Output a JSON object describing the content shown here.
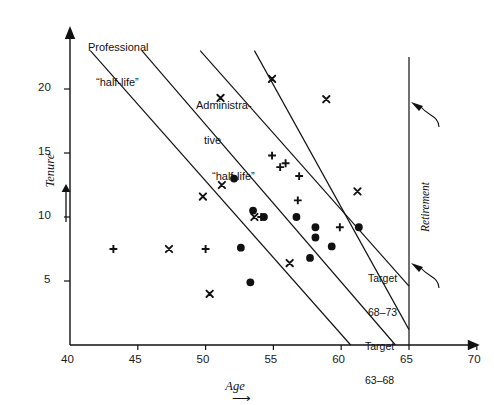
{
  "figure": {
    "kind": "scatter-plot",
    "ink_color": "#111111",
    "background": "#ffffff"
  },
  "axes": {
    "x": {
      "label": "Age",
      "label_arrow": "⟶",
      "ticks": [
        40,
        45,
        50,
        55,
        60,
        65,
        70
      ],
      "min": 40,
      "max": 70,
      "arrow_head": true
    },
    "y": {
      "label": "Tenure",
      "label_arrow": "↑",
      "ticks": [
        5,
        10,
        15,
        20
      ],
      "min": 0,
      "max": 23,
      "arrow_head": true
    }
  },
  "annotations": {
    "professional": {
      "line1": "Professional",
      "line2": "“half-life”"
    },
    "administrative": {
      "line1": "Administra-",
      "line2": "tive",
      "line3": "“half-life”"
    },
    "retirement": {
      "label": "Retirement",
      "age": 65
    },
    "target_upper": {
      "line1": "Target",
      "line2": "68–73"
    },
    "target_lower": {
      "line1": "Target",
      "line2": "63–68"
    }
  },
  "chart_data": {
    "type": "scatter",
    "title": "",
    "xlabel": "Age",
    "ylabel": "Tenure",
    "xlim": [
      40,
      70
    ],
    "ylim": [
      0,
      23
    ],
    "xticks": [
      40,
      45,
      50,
      55,
      60,
      65,
      70
    ],
    "yticks": [
      5,
      10,
      15,
      20
    ],
    "grid": false,
    "legend": "none",
    "series": [
      {
        "name": "circle",
        "marker": "filled-circle",
        "points": [
          [
            52.1,
            13.0
          ],
          [
            53.5,
            10.5
          ],
          [
            54.3,
            10.0
          ],
          [
            56.7,
            10.0
          ],
          [
            58.1,
            9.2
          ],
          [
            58.1,
            8.4
          ],
          [
            59.3,
            7.7
          ],
          [
            61.3,
            9.2
          ],
          [
            52.6,
            7.6
          ],
          [
            57.7,
            6.8
          ],
          [
            53.3,
            4.9
          ]
        ]
      },
      {
        "name": "cross",
        "marker": "x",
        "points": [
          [
            51.1,
            19.3
          ],
          [
            54.9,
            20.8
          ],
          [
            58.9,
            19.2
          ],
          [
            51.2,
            12.5
          ],
          [
            49.8,
            11.6
          ],
          [
            53.6,
            10.0
          ],
          [
            61.2,
            12.0
          ],
          [
            56.2,
            6.4
          ],
          [
            50.3,
            4.0
          ],
          [
            47.3,
            7.5
          ]
        ]
      },
      {
        "name": "plus",
        "marker": "+",
        "points": [
          [
            54.9,
            14.8
          ],
          [
            55.9,
            14.2
          ],
          [
            55.5,
            13.9
          ],
          [
            56.9,
            13.2
          ],
          [
            56.8,
            11.3
          ],
          [
            54.1,
            10.0
          ],
          [
            59.9,
            9.2
          ],
          [
            43.2,
            7.5
          ],
          [
            50.0,
            7.5
          ]
        ]
      }
    ],
    "reference_lines": [
      {
        "name": "professional-half-life",
        "p1": [
          41.5,
          23.0
        ],
        "p2": [
          60.7,
          0.0
        ]
      },
      {
        "name": "administrative-half-life",
        "p1": [
          45.3,
          23.0
        ],
        "p2": [
          64.0,
          0.0
        ]
      },
      {
        "name": "target-68-73",
        "p1": [
          49.6,
          23.0
        ],
        "p2": [
          65.0,
          4.6
        ]
      },
      {
        "name": "target-63-68",
        "p1": [
          53.6,
          23.0
        ],
        "p2": [
          65.0,
          1.2
        ]
      }
    ],
    "vertical_lines": [
      {
        "name": "retirement",
        "x": 65,
        "y_from": 0,
        "y_to": 22.5
      }
    ]
  }
}
